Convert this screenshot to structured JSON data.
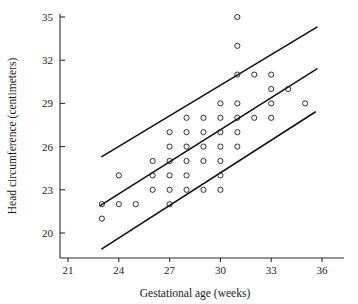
{
  "chart_data": {
    "type": "scatter",
    "title": "",
    "xlabel": "Gestational age (weeks)",
    "ylabel": "Head circumference (centimeters)",
    "xlim": [
      20.2,
      37.2
    ],
    "ylim": [
      18.6,
      35.8
    ],
    "xticks": [
      21,
      24,
      27,
      30,
      33,
      36
    ],
    "yticks": [
      20,
      23,
      26,
      29,
      32,
      35
    ],
    "xtick_labels": [
      "21",
      "24",
      "27",
      "30",
      "33",
      "36"
    ],
    "ytick_labels": [
      "20",
      "23",
      "26",
      "29",
      "32",
      "35"
    ],
    "grid": false,
    "legend": "none",
    "marker": "open-circle",
    "points": [
      [
        23.0,
        21.0
      ],
      [
        23.0,
        22.0
      ],
      [
        24.0,
        22.0
      ],
      [
        24.0,
        24.0
      ],
      [
        25.0,
        22.0
      ],
      [
        26.0,
        23.0
      ],
      [
        26.0,
        24.0
      ],
      [
        26.0,
        25.0
      ],
      [
        27.0,
        22.0
      ],
      [
        27.0,
        23.0
      ],
      [
        27.0,
        24.0
      ],
      [
        27.0,
        25.0
      ],
      [
        27.0,
        26.0
      ],
      [
        27.0,
        27.0
      ],
      [
        28.0,
        23.0
      ],
      [
        28.0,
        24.0
      ],
      [
        28.0,
        25.0
      ],
      [
        28.0,
        26.0
      ],
      [
        28.0,
        27.0
      ],
      [
        28.0,
        28.0
      ],
      [
        29.0,
        23.0
      ],
      [
        29.0,
        25.0
      ],
      [
        29.0,
        26.0
      ],
      [
        29.0,
        27.0
      ],
      [
        29.0,
        28.0
      ],
      [
        30.0,
        23.0
      ],
      [
        30.0,
        24.0
      ],
      [
        30.0,
        25.0
      ],
      [
        30.0,
        26.0
      ],
      [
        30.0,
        27.0
      ],
      [
        30.0,
        28.0
      ],
      [
        30.0,
        29.0
      ],
      [
        31.0,
        26.0
      ],
      [
        31.0,
        27.0
      ],
      [
        31.0,
        28.0
      ],
      [
        31.0,
        29.0
      ],
      [
        31.0,
        31.0
      ],
      [
        31.0,
        33.0
      ],
      [
        31.0,
        35.0
      ],
      [
        32.0,
        28.0
      ],
      [
        32.0,
        31.0
      ],
      [
        33.0,
        28.0
      ],
      [
        33.0,
        29.0
      ],
      [
        33.0,
        30.0
      ],
      [
        33.0,
        31.0
      ],
      [
        34.0,
        30.0
      ],
      [
        35.0,
        29.0
      ]
    ],
    "lines": [
      {
        "name": "upper-bound-line",
        "x": [
          23.0,
          35.7
        ],
        "y": [
          25.3,
          34.3
        ]
      },
      {
        "name": "fit-line",
        "x": [
          22.9,
          35.7
        ],
        "y": [
          21.9,
          31.4
        ]
      },
      {
        "name": "lower-bound-line",
        "x": [
          23.0,
          35.6
        ],
        "y": [
          18.9,
          28.4
        ]
      }
    ]
  }
}
